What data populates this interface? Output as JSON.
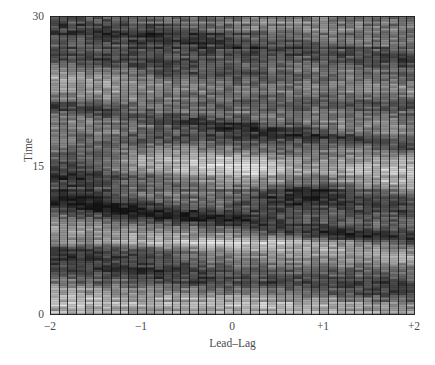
{
  "figure": {
    "background_color": "#ffffff",
    "text_color": "#4a4a4a",
    "plot_left_px": 50,
    "plot_top_px": 16,
    "plot_width_px": 365,
    "plot_height_px": 299
  },
  "axes": {
    "y": {
      "label": "Time",
      "ticks": [
        {
          "value": 0,
          "label": "0"
        },
        {
          "value": 15,
          "label": "15"
        },
        {
          "value": 30,
          "label": "30"
        }
      ],
      "min": 0,
      "max": 30
    },
    "x": {
      "label": "Lead–Lag",
      "ticks": [
        {
          "value": -2,
          "label": "−2"
        },
        {
          "value": -1,
          "label": "−1"
        },
        {
          "value": 0,
          "label": "0"
        },
        {
          "value": 1,
          "label": "+1"
        },
        {
          "value": 2,
          "label": "+2"
        }
      ],
      "min": -2,
      "max": 2
    }
  },
  "chart_data": {
    "type": "heatmap",
    "title": "",
    "xlabel": "Lead–Lag",
    "ylabel": "Time",
    "xlim": [
      -2,
      2
    ],
    "ylim": [
      0,
      30
    ],
    "grid": true,
    "legend": "none",
    "colormap": "grayscale",
    "colormap_min_hex": "#141414",
    "colormap_max_hex": "#f2f2f2",
    "n_cols": 42,
    "n_rows": 130,
    "grid_line_color": "#1a1a1a",
    "col_gridline_every": 1,
    "row_gridline_every": 1,
    "ridges": [
      {
        "name": "dark-ridge-1",
        "time_at_left": 29.0,
        "time_at_right": 25.5,
        "polarity": "dark"
      },
      {
        "name": "dark-ridge-2",
        "time_at_left": 26.0,
        "time_at_right": 21.5,
        "polarity": "dark"
      },
      {
        "name": "light-band-1",
        "time_at_left": 24.0,
        "time_at_right": 22.5,
        "polarity": "light"
      },
      {
        "name": "dark-ridge-3",
        "time_at_left": 21.0,
        "time_at_right": 17.0,
        "polarity": "dark"
      },
      {
        "name": "light-lobe-center",
        "time_at_left": 15.5,
        "time_at_right": 14.0,
        "polarity": "light"
      },
      {
        "name": "dark-ridge-4",
        "time_at_left": 15.0,
        "time_at_right": 11.0,
        "polarity": "dark"
      },
      {
        "name": "dark-ridge-5",
        "time_at_left": 11.5,
        "time_at_right": 7.5,
        "polarity": "dark"
      },
      {
        "name": "light-band-2",
        "time_at_left": 8.5,
        "time_at_right": 6.0,
        "polarity": "light"
      },
      {
        "name": "dark-ridge-6",
        "time_at_left": 5.5,
        "time_at_right": 2.0,
        "polarity": "dark"
      },
      {
        "name": "light-band-3",
        "time_at_left": 1.5,
        "time_at_right": 0.8,
        "polarity": "light"
      }
    ]
  }
}
